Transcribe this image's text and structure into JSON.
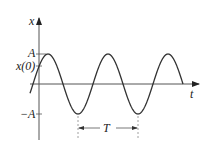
{
  "diagram": {
    "axes": {
      "y_label": "x",
      "x_label": "t"
    },
    "labels": {
      "amplitude": "A",
      "neg_amplitude": "−A",
      "initial": "x(0)",
      "period": "T"
    },
    "curve": {
      "type": "cosine",
      "center_px": 84,
      "amplitude_px": 30,
      "period_px": 60,
      "first_peak_x_px": 48,
      "x_start_px": 30,
      "x_end_px": 183
    },
    "colors": {
      "curve": "#333333",
      "axis": "#555555",
      "guide": "#888888"
    }
  }
}
